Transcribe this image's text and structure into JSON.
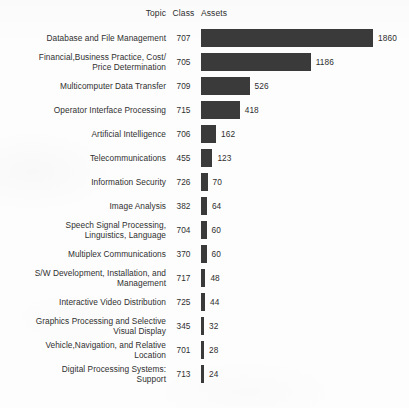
{
  "headers": {
    "topic": "Topic",
    "class": "Class",
    "assets": "Assets"
  },
  "style": {
    "bar_color": "#3a3a3a",
    "text_color": "#303030",
    "background": "#fdfdfd"
  },
  "chart_data": {
    "type": "bar",
    "orientation": "horizontal",
    "title": "",
    "xlabel": "Assets",
    "ylabel": "Topic",
    "grid": false,
    "legend": null,
    "xlim": [
      0,
      1860
    ],
    "max_value": 1860,
    "categories": [
      "Database and File Management",
      "Financial,Business Practice, Cost/\nPrice Determination",
      "Multicomputer Data Transfer",
      "Operator Interface Processing",
      "Artificial Intelligence",
      "Telecommunications",
      "Information Security",
      "Image Analysis",
      "Speech Signal Processing,\nLinguistics, Language",
      "Multiplex Communications",
      "S/W Development, Installation, and\nManagement",
      "Interactive Video Distribution",
      "Graphics Processing and Selective\nVisual Display",
      "Vehicle,Navigation, and Relative\nLocation",
      "Digital Processing Systems:\nSupport"
    ],
    "classes": [
      "707",
      "705",
      "709",
      "715",
      "706",
      "455",
      "726",
      "382",
      "704",
      "370",
      "717",
      "725",
      "345",
      "701",
      "713"
    ],
    "values": [
      1860,
      1186,
      526,
      418,
      162,
      123,
      70,
      64,
      60,
      60,
      48,
      44,
      32,
      28,
      24
    ],
    "rows": [
      {
        "topic": "Database and File Management",
        "class": "707",
        "value": 1860,
        "label": "1860"
      },
      {
        "topic": "Financial,Business Practice, Cost/\nPrice Determination",
        "class": "705",
        "value": 1186,
        "label": "1186"
      },
      {
        "topic": "Multicomputer Data Transfer",
        "class": "709",
        "value": 526,
        "label": "526"
      },
      {
        "topic": "Operator Interface Processing",
        "class": "715",
        "value": 418,
        "label": "418"
      },
      {
        "topic": "Artificial Intelligence",
        "class": "706",
        "value": 162,
        "label": "162"
      },
      {
        "topic": "Telecommunications",
        "class": "455",
        "value": 123,
        "label": "123"
      },
      {
        "topic": "Information Security",
        "class": "726",
        "value": 70,
        "label": "70"
      },
      {
        "topic": "Image Analysis",
        "class": "382",
        "value": 64,
        "label": "64"
      },
      {
        "topic": "Speech Signal Processing,\nLinguistics, Language",
        "class": "704",
        "value": 60,
        "label": "60"
      },
      {
        "topic": "Multiplex Communications",
        "class": "370",
        "value": 60,
        "label": "60"
      },
      {
        "topic": "S/W Development, Installation, and\nManagement",
        "class": "717",
        "value": 48,
        "label": "48"
      },
      {
        "topic": "Interactive Video Distribution",
        "class": "725",
        "value": 44,
        "label": "44"
      },
      {
        "topic": "Graphics Processing and Selective\nVisual Display",
        "class": "345",
        "value": 32,
        "label": "32"
      },
      {
        "topic": "Vehicle,Navigation, and Relative\nLocation",
        "class": "701",
        "value": 28,
        "label": "28"
      },
      {
        "topic": "Digital Processing Systems:\nSupport",
        "class": "713",
        "value": 24,
        "label": "24"
      }
    ]
  }
}
